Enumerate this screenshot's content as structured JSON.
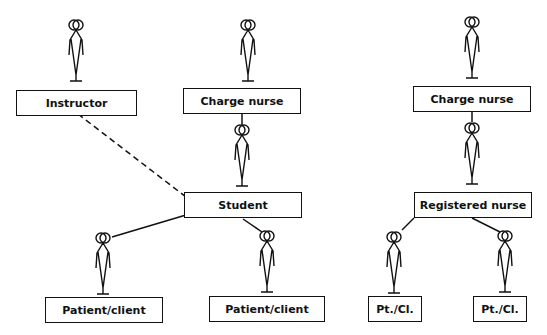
{
  "diagram": {
    "left": {
      "instructor": "Instructor",
      "charge_nurse": "Charge nurse",
      "student": "Student",
      "patient_client_1": "Patient/client",
      "patient_client_2": "Patient/client"
    },
    "right": {
      "charge_nurse": "Charge nurse",
      "registered_nurse": "Registered nurse",
      "pt_cl_1": "Pt./Cl.",
      "pt_cl_2": "Pt./Cl."
    },
    "colors": {
      "line": "#111111",
      "background": "#ffffff"
    }
  }
}
